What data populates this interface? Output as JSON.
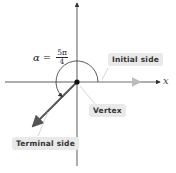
{
  "diagram": {
    "angle_label": {
      "symbol": "α",
      "equals": "=",
      "numerator": "5π",
      "denominator": "4"
    },
    "axis_label_x": "x",
    "labels": {
      "initial_side": "Initial side",
      "vertex": "Vertex",
      "terminal_side": "Terminal side"
    },
    "colors": {
      "axis": "#333333",
      "initial_side": "#b8b8b8",
      "terminal_side": "#555555",
      "label_bg": "#e9e9e9"
    }
  }
}
